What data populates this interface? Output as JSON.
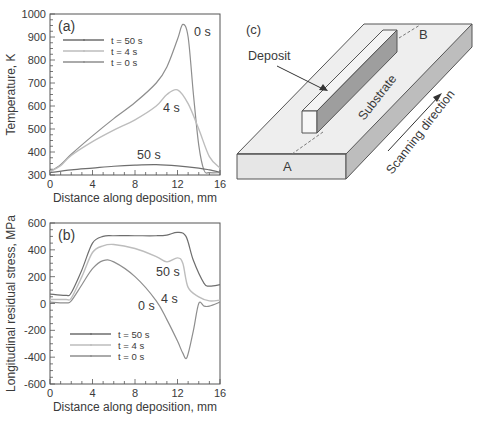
{
  "chart_data": [
    {
      "panel": "(a)",
      "type": "line",
      "xlabel": "Distance along deposition, mm",
      "ylabel": "Temperature, K",
      "xlim": [
        0,
        16
      ],
      "ylim": [
        300,
        1000
      ],
      "xticks": [
        0,
        4,
        8,
        12,
        16
      ],
      "yticks": [
        300,
        400,
        500,
        600,
        700,
        800,
        900,
        1000
      ],
      "legend": [
        "t = 50 s",
        "t = 4 s",
        "t = 0 s"
      ],
      "annotations": [
        "0 s",
        "4 s",
        "50 s"
      ],
      "series": [
        {
          "name": "t = 50 s",
          "color": "#6e6e6e",
          "x": [
            0,
            2,
            4,
            6,
            8,
            10,
            12,
            14,
            15,
            16
          ],
          "y": [
            310,
            322,
            330,
            338,
            343,
            345,
            340,
            330,
            322,
            312
          ]
        },
        {
          "name": "t = 4 s",
          "color": "#bdbdbd",
          "x": [
            0,
            1,
            2,
            4,
            6,
            8,
            10,
            11,
            12,
            13,
            14,
            15,
            16
          ],
          "y": [
            315,
            340,
            385,
            445,
            495,
            540,
            600,
            650,
            670,
            610,
            500,
            380,
            330
          ]
        },
        {
          "name": "t = 0 s",
          "color": "#8e8e8e",
          "x": [
            0,
            1,
            2,
            4,
            6,
            8,
            10,
            11,
            12,
            12.5,
            13,
            13.5,
            14,
            14.5,
            15,
            16
          ],
          "y": [
            315,
            345,
            390,
            470,
            545,
            615,
            700,
            770,
            890,
            955,
            900,
            650,
            430,
            320,
            310,
            310
          ]
        }
      ]
    },
    {
      "panel": "(b)",
      "type": "line",
      "xlabel": "Distance along deposition, mm",
      "ylabel": "Longitudinal residual stress, MPa",
      "xlim": [
        0,
        16
      ],
      "ylim": [
        -600,
        600
      ],
      "xticks": [
        0,
        4,
        8,
        12,
        16
      ],
      "yticks": [
        -600,
        -400,
        -200,
        0,
        200,
        400,
        600
      ],
      "legend": [
        "t = 50 s",
        "t = 4 s",
        "t = 0 s"
      ],
      "annotations": [
        "50 s",
        "4 s",
        "0 s"
      ],
      "series": [
        {
          "name": "t = 50 s",
          "color": "#6e6e6e",
          "x": [
            0,
            1.5,
            2,
            3,
            4,
            5,
            6,
            8,
            10,
            11,
            12,
            12.8,
            13.5,
            14.5,
            15,
            16
          ],
          "y": [
            70,
            60,
            80,
            250,
            450,
            500,
            505,
            505,
            505,
            510,
            530,
            500,
            320,
            150,
            130,
            140
          ]
        },
        {
          "name": "t = 4 s",
          "color": "#bdbdbd",
          "x": [
            0,
            1.5,
            2,
            3,
            4,
            5,
            6,
            8,
            10,
            11,
            12,
            12.5,
            13,
            14,
            15,
            16
          ],
          "y": [
            30,
            30,
            40,
            200,
            380,
            430,
            440,
            410,
            350,
            310,
            340,
            300,
            120,
            50,
            20,
            25
          ]
        },
        {
          "name": "t = 0 s",
          "color": "#8e8e8e",
          "x": [
            0,
            1.5,
            2,
            3,
            4,
            5,
            6,
            8,
            10,
            11,
            12,
            12.5,
            12.9,
            13.5,
            14,
            14.5,
            15,
            16
          ],
          "y": [
            10,
            5,
            20,
            140,
            260,
            320,
            310,
            200,
            20,
            -120,
            -280,
            -370,
            -400,
            -200,
            0,
            -20,
            -20,
            10
          ]
        }
      ]
    }
  ],
  "diagram": {
    "panel": "(c)",
    "labels": {
      "deposit": "Deposit",
      "substrate": "Substrate",
      "a": "A",
      "b": "B",
      "scanning": "Scanning direction"
    }
  },
  "panel_labels": {
    "a": "(a)",
    "b": "(b)",
    "c": "(c)"
  }
}
